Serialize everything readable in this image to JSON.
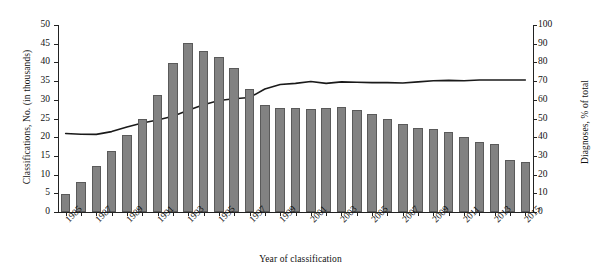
{
  "chart_data": {
    "type": "bar",
    "title": "",
    "xlabel": "Year of classification",
    "ylabel": "Classifications, No. (in thousands)",
    "y2label": "Diagnoses, % of total",
    "ylim": [
      0,
      50
    ],
    "y2lim": [
      0,
      100
    ],
    "grid": false,
    "legend": "none",
    "yticks": [
      0,
      5,
      10,
      15,
      20,
      25,
      30,
      35,
      40,
      45,
      50
    ],
    "y2ticks": [
      0,
      10,
      20,
      30,
      40,
      50,
      60,
      70,
      80,
      90,
      100
    ],
    "categories": [
      "1985",
      "1986",
      "1987",
      "1988",
      "1989",
      "1990",
      "1991",
      "1992",
      "1993",
      "1994",
      "1995",
      "1996",
      "1997",
      "1998",
      "1999",
      "2000",
      "2001",
      "2002",
      "2003",
      "2004",
      "2005",
      "2006",
      "2007",
      "2008",
      "2009",
      "2010",
      "2011",
      "2012",
      "2013",
      "2014",
      "2015"
    ],
    "xtick_labels": [
      "1985",
      "1987",
      "1989",
      "1991",
      "1993",
      "1995",
      "1997",
      "1999",
      "2001",
      "2003",
      "2005",
      "2007",
      "2009",
      "2011",
      "2013",
      "2015"
    ],
    "series": [
      {
        "name": "Classifications, No. (in thousands)",
        "type": "bar",
        "axis": "left",
        "color": "#828282",
        "values": [
          4.9,
          8.1,
          12.3,
          16.4,
          20.7,
          24.8,
          31.3,
          39.9,
          45.1,
          43.0,
          41.4,
          38.6,
          32.9,
          28.5,
          27.7,
          27.9,
          27.6,
          27.8,
          28.1,
          27.3,
          26.3,
          25.0,
          23.5,
          22.4,
          22.2,
          21.3,
          20.0,
          18.7,
          18.1,
          14.0,
          13.3
        ]
      },
      {
        "name": "Diagnoses, % of total",
        "type": "line",
        "axis": "right",
        "color": "#1a1a1a",
        "values": [
          42.0,
          41.6,
          41.5,
          43.0,
          45.4,
          47.6,
          49.2,
          51.2,
          54.4,
          57.4,
          59.6,
          60.6,
          61.2,
          65.8,
          68.2,
          68.8,
          69.8,
          68.8,
          69.6,
          69.4,
          69.2,
          69.2,
          69.0,
          69.6,
          70.2,
          70.4,
          70.2,
          70.6,
          70.6,
          70.6,
          70.6
        ]
      }
    ]
  }
}
